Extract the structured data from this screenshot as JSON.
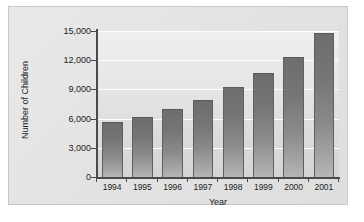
{
  "chart_data": {
    "type": "bar",
    "title": "",
    "xlabel": "Year",
    "ylabel": "Number of Children",
    "categories": [
      "1994",
      "1995",
      "1996",
      "1997",
      "1998",
      "1999",
      "2000",
      "2001"
    ],
    "values": [
      5500,
      6100,
      6900,
      7800,
      9100,
      10600,
      12200,
      14700
    ],
    "ylim": [
      0,
      15000
    ],
    "yticks": [
      0,
      3000,
      6000,
      9000,
      12000,
      15000
    ],
    "ytick_labels": [
      "0",
      "3,000",
      "6,000",
      "9,000",
      "12,000",
      "15,000"
    ],
    "grid": true,
    "gridline_color": "#ffffff",
    "legend": null,
    "bar_color": "#7b7b7b",
    "plot_background": "#e6e6e6",
    "panel_background": "#e4e4e4",
    "axis_color": "#4a4a4a"
  },
  "axes": {
    "y_title": "Number of Children",
    "x_title": "Year"
  }
}
